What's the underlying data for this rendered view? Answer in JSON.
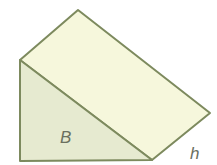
{
  "diagram": {
    "type": "triangular-prism",
    "labels": {
      "base": "B",
      "height": "h"
    },
    "colors": {
      "stroke": "#7d8a5e",
      "top_face": "#f6f7dc",
      "base_face": "#e6ead0",
      "label": "#6b7060"
    }
  }
}
